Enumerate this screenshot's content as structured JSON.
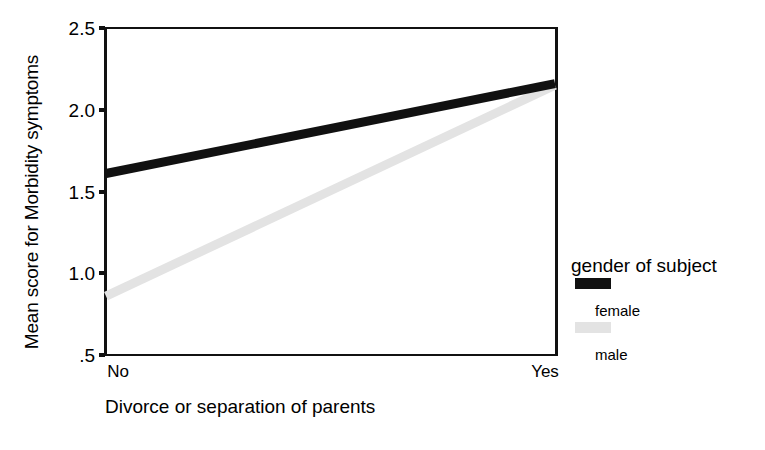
{
  "chart_data": {
    "type": "line",
    "title": "",
    "xlabel": "Divorce or separation of parents",
    "ylabel": "Mean score for Morbidity symptoms",
    "categories": [
      "No",
      "Yes"
    ],
    "x": [
      0,
      1
    ],
    "ylim": [
      0.5,
      2.5
    ],
    "yticks": [
      0.5,
      1.0,
      1.5,
      2.0,
      2.5
    ],
    "ytick_labels": [
      ".5",
      "1.0",
      "1.5",
      "2.0",
      "2.5"
    ],
    "grid": false,
    "legend_position": "right",
    "legend_title": "gender of subject",
    "series": [
      {
        "name": "female",
        "values": [
          1.61,
          2.16
        ],
        "color": "#111111",
        "swatch": "black-swatch"
      },
      {
        "name": "male",
        "values": [
          0.86,
          2.15
        ],
        "color": "#e3e3e3",
        "swatch": "light-gray-swatch"
      }
    ]
  },
  "axes": {
    "y_title": "Mean score for Morbidity symptoms",
    "x_title": "Divorce or separation of parents",
    "y_tick_labels": [
      {
        "value": 2.5,
        "text": "2.5"
      },
      {
        "value": 2.0,
        "text": "2.0"
      },
      {
        "value": 1.5,
        "text": "1.5"
      },
      {
        "value": 1.0,
        "text": "1.0"
      },
      {
        "value": 0.5,
        "text": ".5"
      }
    ],
    "x_tick_labels": [
      {
        "value": 0,
        "text": "No"
      },
      {
        "value": 1,
        "text": "Yes"
      }
    ]
  },
  "legend": {
    "title": "gender of subject",
    "entries": [
      {
        "label": "female",
        "color": "#111111"
      },
      {
        "label": "male",
        "color": "#e3e3e3"
      }
    ]
  }
}
